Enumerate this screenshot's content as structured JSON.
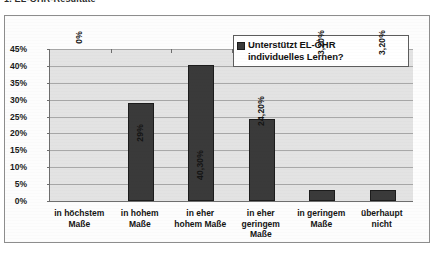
{
  "top_fragment": "1. EL-ÖHR-Resultate",
  "legend": {
    "label": "Unterstützt EL-ÖHR individuelles Lernen?",
    "line1": "Unterstützt EL-ÖHR",
    "line2": "individuelles Lernen?",
    "swatch_color": "#3a3a3a"
  },
  "chart_data": {
    "type": "bar",
    "title": "",
    "xlabel": "",
    "ylabel": "",
    "ylim": [
      0,
      45
    ],
    "ytick_step": 5,
    "grid": true,
    "legend_position": "top-right",
    "series_name": "Unterstützt EL-ÖHR individuelles Lernen?",
    "categories": [
      "in höchstem Maße",
      "in hohem Maße",
      "in eher hohem Maße",
      "in eher geringem Maße",
      "in geringem Maße",
      "überhaupt nicht"
    ],
    "values": [
      0,
      29,
      40.3,
      24.2,
      3.2,
      3.2
    ],
    "data_labels": [
      "0%",
      "29%",
      "40,30%",
      "24,20%",
      "3,20%",
      "3,20%"
    ],
    "ytick_labels": [
      "45%",
      "40%",
      "35%",
      "30%",
      "25%",
      "20%",
      "15%",
      "10%",
      "5%",
      "0%"
    ],
    "bar_color": "#3a3a3a",
    "plot_background": "#e3e3e3"
  },
  "axis": {
    "y_labels": [
      "45%",
      "40%",
      "35%",
      "30%",
      "25%",
      "20%",
      "15%",
      "10%",
      "5%",
      "0%"
    ],
    "x_labels": [
      {
        "line1": "in höchstem",
        "line2": "Maße",
        "line3": ""
      },
      {
        "line1": "in hohem",
        "line2": "Maße",
        "line3": ""
      },
      {
        "line1": "in eher",
        "line2": "hohem Maße",
        "line3": ""
      },
      {
        "line1": "in eher",
        "line2": "geringem",
        "line3": "Maße"
      },
      {
        "line1": "in geringem",
        "line2": "Maße",
        "line3": ""
      },
      {
        "line1": "überhaupt",
        "line2": "nicht",
        "line3": ""
      }
    ]
  }
}
